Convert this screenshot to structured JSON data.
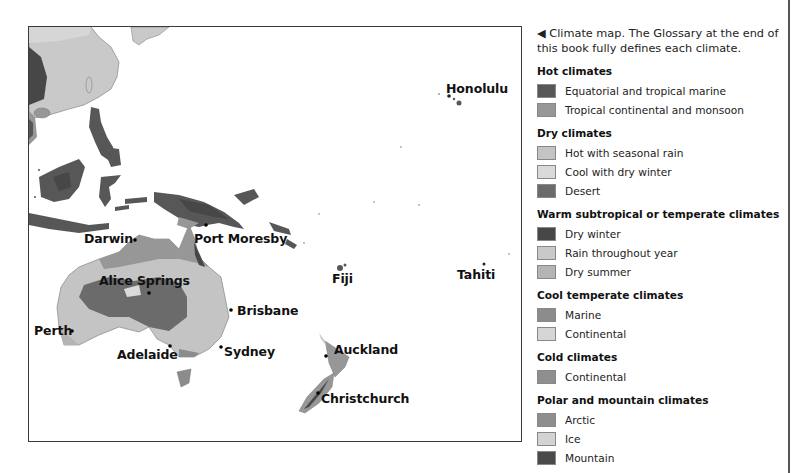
{
  "map": {
    "cities": [
      {
        "name": "Honolulu",
        "label_x": 417,
        "label_y": 54
      },
      {
        "name": "Darwin",
        "label_x": 55,
        "label_y": 205
      },
      {
        "name": "Port Moresby",
        "label_x": 165,
        "label_y": 205
      },
      {
        "name": "Alice Springs",
        "label_x": 70,
        "label_y": 248
      },
      {
        "name": "Fiji",
        "label_x": 303,
        "label_y": 246
      },
      {
        "name": "Tahiti",
        "label_x": 428,
        "label_y": 241
      },
      {
        "name": "Brisbane",
        "label_x": 208,
        "label_y": 277
      },
      {
        "name": "Perth",
        "label_x": 5,
        "label_y": 297
      },
      {
        "name": "Adelaide",
        "label_x": 88,
        "label_y": 321
      },
      {
        "name": "Sydney",
        "label_x": 195,
        "label_y": 318
      },
      {
        "name": "Auckland",
        "label_x": 305,
        "label_y": 316
      },
      {
        "name": "Christchurch",
        "label_x": 292,
        "label_y": 365
      }
    ]
  },
  "legend": {
    "caption_arrow": "◀",
    "caption": "Climate map. The Glossary at the end of this book fully defines each climate.",
    "groups": [
      {
        "title": "Hot climates",
        "items": [
          {
            "label": "Equatorial and tropical marine",
            "color": "#575757"
          },
          {
            "label": "Tropical continental and monsoon",
            "color": "#979797"
          }
        ]
      },
      {
        "title": "Dry climates",
        "items": [
          {
            "label": "Hot with seasonal rain",
            "color": "#c4c4c4"
          },
          {
            "label": "Cool with dry winter",
            "color": "#dadada"
          },
          {
            "label": "Desert",
            "color": "#6b6b6b"
          }
        ]
      },
      {
        "title": "Warm subtropical or temperate climates",
        "items": [
          {
            "label": "Dry winter",
            "color": "#474747"
          },
          {
            "label": "Rain throughout year",
            "color": "#c9c9c9"
          },
          {
            "label": "Dry summer",
            "color": "#b4b4b4"
          }
        ]
      },
      {
        "title": "Cool temperate climates",
        "items": [
          {
            "label": "Marine",
            "color": "#8c8c8c"
          },
          {
            "label": "Continental",
            "color": "#d6d6d6"
          }
        ]
      },
      {
        "title": "Cold climates",
        "items": [
          {
            "label": "Continental",
            "color": "#8f8f8f"
          }
        ]
      },
      {
        "title": "Polar and mountain climates",
        "items": [
          {
            "label": "Arctic",
            "color": "#8e8e8e"
          },
          {
            "label": "Ice",
            "color": "#d3d3d3"
          },
          {
            "label": "Mountain",
            "color": "#4a4a4a"
          }
        ]
      }
    ]
  }
}
